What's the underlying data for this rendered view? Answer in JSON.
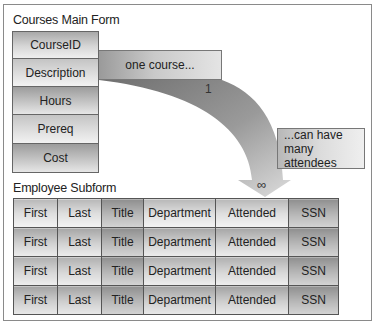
{
  "main_form": {
    "title": "Courses Main Form",
    "fields": [
      "CourseID",
      "Description",
      "Hours",
      "Prereq",
      "Cost"
    ]
  },
  "relationship": {
    "one_label": "one course...",
    "many_label_line1": "...can have",
    "many_label_line2": "many attendees",
    "one_marker": "1",
    "many_marker": "∞"
  },
  "subform": {
    "title": "Employee Subform",
    "columns": [
      "First",
      "Last",
      "Title",
      "Department",
      "Attended",
      "SSN"
    ],
    "rows": [
      [
        "First",
        "Last",
        "Title",
        "Department",
        "Attended",
        "SSN"
      ],
      [
        "First",
        "Last",
        "Title",
        "Department",
        "Attended",
        "SSN"
      ],
      [
        "First",
        "Last",
        "Title",
        "Department",
        "Attended",
        "SSN"
      ],
      [
        "First",
        "Last",
        "Title",
        "Department",
        "Attended",
        "SSN"
      ]
    ]
  },
  "colors": {
    "frame_border": "#8a8a8a",
    "cell_border": "#555555",
    "arrow_dark": "#7a7a7a",
    "arrow_light": "#d8d8d8"
  }
}
